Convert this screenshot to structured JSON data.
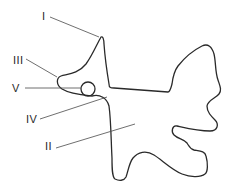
{
  "diagram": {
    "colors": {
      "stroke": "#2a2a2a",
      "leader": "#4a4a4a",
      "background": "#ffffff"
    },
    "labels": {
      "I": "I",
      "II": "II",
      "III": "III",
      "IV": "IV",
      "V": "V"
    }
  }
}
